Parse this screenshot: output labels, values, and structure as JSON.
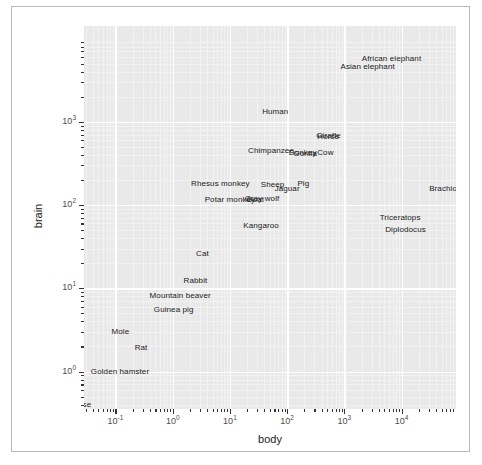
{
  "chart_data": {
    "type": "scatter",
    "title": "",
    "xlabel": "body",
    "ylabel": "brain",
    "xscale": "log10",
    "yscale": "log10",
    "xlim": [
      -1.55,
      4.95
    ],
    "ylim": [
      -0.45,
      4.15
    ],
    "grid": true,
    "legend": null,
    "point_marker": "text-label",
    "xticks": [
      {
        "value": -1,
        "label": "10",
        "exp": "-1"
      },
      {
        "value": 0,
        "label": "10",
        "exp": "0"
      },
      {
        "value": 1,
        "label": "10",
        "exp": "1"
      },
      {
        "value": 2,
        "label": "10",
        "exp": "2"
      },
      {
        "value": 3,
        "label": "10",
        "exp": "3"
      },
      {
        "value": 4,
        "label": "10",
        "exp": "4"
      }
    ],
    "yticks": [
      {
        "value": 0,
        "label": "10",
        "exp": "0"
      },
      {
        "value": 1,
        "label": "10",
        "exp": "1"
      },
      {
        "value": 2,
        "label": "10",
        "exp": "2"
      },
      {
        "value": 3,
        "label": "10",
        "exp": "3"
      }
    ],
    "points": [
      {
        "label": "Mountain beaver",
        "x": 1.35,
        "y": 8.1
      },
      {
        "label": "Cow",
        "x": 465,
        "y": 423
      },
      {
        "label": "Gray wolf",
        "x": 36.33,
        "y": 119.5
      },
      {
        "label": "Goat",
        "x": 27.66,
        "y": 115
      },
      {
        "label": "Guinea pig",
        "x": 1.04,
        "y": 5.5
      },
      {
        "label": "Diplodocus",
        "x": 11700,
        "y": 50
      },
      {
        "label": "Asian elephant",
        "x": 2547,
        "y": 4603
      },
      {
        "label": "Donkey",
        "x": 187.1,
        "y": 419
      },
      {
        "label": "Horse",
        "x": 521,
        "y": 655
      },
      {
        "label": "Potar monkey",
        "x": 10,
        "y": 115
      },
      {
        "label": "Cat",
        "x": 3.3,
        "y": 25.6
      },
      {
        "label": "Giraffe",
        "x": 529,
        "y": 680
      },
      {
        "label": "Gorilla",
        "x": 207,
        "y": 406
      },
      {
        "label": "Human",
        "x": 62,
        "y": 1320
      },
      {
        "label": "African elephant",
        "x": 6654,
        "y": 5712
      },
      {
        "label": "Triceratops",
        "x": 9400,
        "y": 70
      },
      {
        "label": "Rhesus monkey",
        "x": 6.8,
        "y": 179
      },
      {
        "label": "Kangaroo",
        "x": 35,
        "y": 56
      },
      {
        "label": "Golden hamster",
        "x": 0.12,
        "y": 1
      },
      {
        "label": "Mouse",
        "x": 0.023,
        "y": 0.4
      },
      {
        "label": "Rabbit",
        "x": 2.5,
        "y": 12.1
      },
      {
        "label": "Sheep",
        "x": 55.5,
        "y": 175
      },
      {
        "label": "Jaguar",
        "x": 100,
        "y": 157
      },
      {
        "label": "Chimpanzee",
        "x": 52.16,
        "y": 440
      },
      {
        "label": "Brachiosaurus",
        "x": 87000,
        "y": 154.5
      },
      {
        "label": "Mole",
        "x": 0.122,
        "y": 3
      },
      {
        "label": "Pig",
        "x": 192,
        "y": 180
      },
      {
        "label": "Rat",
        "x": 0.28,
        "y": 1.9
      }
    ]
  },
  "figure": {
    "panel_background": "#e9e9e9",
    "gridline_color": "#ffffff",
    "border_color": "#b9b9b9",
    "text_color": "#1a1a1a",
    "tick_color": "#4d4d4d"
  }
}
